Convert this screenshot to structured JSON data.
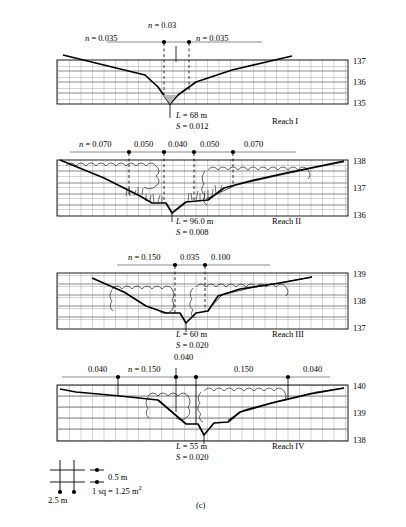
{
  "figure": {
    "label": "(c)",
    "legend": {
      "vertical": "0.5 m",
      "horizontal": "2.5 m",
      "area": "1 sq = 1.25 m",
      "area_exp": "2"
    }
  },
  "reaches": [
    {
      "name": "Reach I",
      "length": "L = 68 m",
      "slope": "S = 0.012",
      "elevations": [
        "137",
        "136",
        "135"
      ],
      "n_labels": [
        "n = 0.035",
        "n = 0.03",
        "n = 0.035"
      ],
      "n_values": [
        0.035,
        0.03,
        0.035
      ]
    },
    {
      "name": "Reach II",
      "length": "L = 96.0 m",
      "slope": "S = 0.008",
      "elevations": [
        "138",
        "137",
        "136"
      ],
      "n_labels": [
        "n = 0.070",
        "0.050",
        "0.040",
        "0.050",
        "0.070"
      ],
      "n_values": [
        0.07,
        0.05,
        0.04,
        0.05,
        0.07
      ]
    },
    {
      "name": "Reach III",
      "length": "L = 60 m",
      "slope": "S = 0.020",
      "elevations": [
        "139",
        "138",
        "137"
      ],
      "n_labels": [
        "n = 0.150",
        "0.035",
        "0.100"
      ],
      "n_values": [
        0.15,
        0.035,
        0.1
      ]
    },
    {
      "name": "Reach IV",
      "length": "L = 55 m",
      "slope": "S = 0.020",
      "elevations": [
        "140",
        "139",
        "138"
      ],
      "n_labels": [
        "0.040",
        "n = 0.150",
        "0.040",
        "0.150",
        "0.040"
      ],
      "n_values": [
        0.04,
        0.15,
        0.04,
        0.15,
        0.04
      ]
    }
  ],
  "colors": {
    "ink": "#000000",
    "grid": "#555555",
    "gridlight": "#999999",
    "background": "#ffffff"
  }
}
